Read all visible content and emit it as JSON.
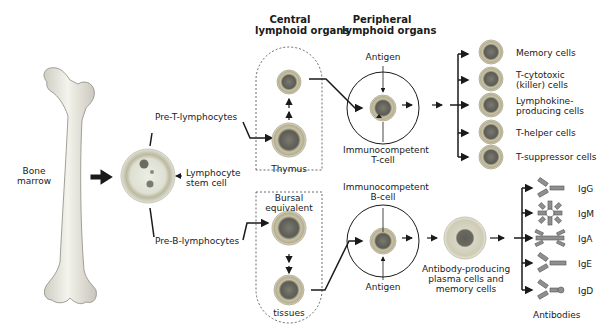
{
  "headers": {
    "central": [
      "Central",
      "lymphoid organs"
    ],
    "peripheral": [
      "Peripheral",
      "lymphoid organs"
    ]
  },
  "bone": {
    "label": [
      "Bone",
      "marrow"
    ]
  },
  "stem_cell": {
    "label": [
      "Lymphocyte",
      "stem cell"
    ]
  },
  "precursors": {
    "pre_t": "Pre-T-lymphocytes",
    "pre_b": "Pre-B-lymphocytes"
  },
  "central_organs": {
    "thymus": "Thymus",
    "bursal": [
      "Bursal",
      "equivalent"
    ],
    "tissues": "tissues"
  },
  "peripheral_organs": {
    "t_antigen": "Antigen",
    "t_cell": [
      "Immunocompetent",
      "T-cell"
    ],
    "b_cell": [
      "Immunocompetent",
      "B-cell"
    ],
    "b_antigen": "Antigen"
  },
  "t_outputs": [
    {
      "label": [
        "Memory cells"
      ]
    },
    {
      "label": [
        "T-cytotoxic",
        "(killer) cells"
      ]
    },
    {
      "label": [
        "Lymphokine-",
        "producing cells"
      ]
    },
    {
      "label": [
        "T-helper cells"
      ]
    },
    {
      "label": [
        "T-suppressor cells"
      ]
    }
  ],
  "plasma": {
    "label": [
      "Antibody-producing",
      "plasma cells and",
      "memory cells"
    ]
  },
  "antibodies": {
    "items": [
      "IgG",
      "IgM",
      "IgA",
      "IgE",
      "IgD"
    ],
    "caption": "Antibodies"
  },
  "colors": {
    "ink": "#1a1a1a",
    "cell_halo": "#d9dccf",
    "cell_ring": "#b9b39a",
    "cell_nucleus": "#6f6f66",
    "bone": "#ecebe3",
    "antibody": "#8f8f8f"
  }
}
